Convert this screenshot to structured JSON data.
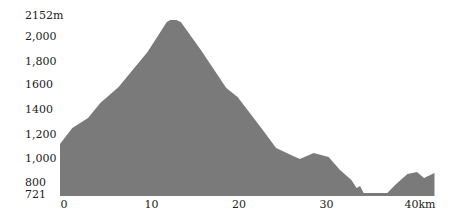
{
  "chart_data": {
    "type": "area",
    "title": "",
    "xlabel": "km",
    "ylabel": "m",
    "fill_color": "#7a7a7a",
    "xlim": [
      0,
      42.8
    ],
    "ylim": [
      721,
      2152
    ],
    "grid": false,
    "legend": null,
    "y_ticks": [
      {
        "value": 2152,
        "label": "2152m"
      },
      {
        "value": 2000,
        "label": "2,000"
      },
      {
        "value": 1800,
        "label": "1,800"
      },
      {
        "value": 1600,
        "label": "1600"
      },
      {
        "value": 1400,
        "label": "1400"
      },
      {
        "value": 1200,
        "label": "1,200"
      },
      {
        "value": 1000,
        "label": "1,000"
      },
      {
        "value": 800,
        "label": "800"
      },
      {
        "value": 721,
        "label": "721"
      }
    ],
    "x_ticks": [
      {
        "value": 0,
        "label": "0"
      },
      {
        "value": 10,
        "label": "10"
      },
      {
        "value": 20,
        "label": "20"
      },
      {
        "value": 30,
        "label": "30"
      },
      {
        "value": 40,
        "label": "40km"
      }
    ],
    "x": [
      0,
      1.4,
      3.2,
      4.6,
      6.7,
      10,
      12.2,
      12.6,
      13.3,
      13.8,
      16.1,
      19,
      20.3,
      23,
      24.7,
      26.4,
      27.4,
      29,
      30.7,
      32,
      33.3,
      33.9,
      34.3,
      34.7,
      37.4,
      38.3,
      39.7,
      40.8,
      41.6,
      42.8
    ],
    "values": [
      1144,
      1274,
      1355,
      1477,
      1607,
      1892,
      2136,
      2152,
      2152,
      2136,
      1908,
      1599,
      1526,
      1274,
      1111,
      1054,
      1022,
      1070,
      1038,
      932,
      851,
      786,
      802,
      745,
      745,
      810,
      900,
      916,
      867,
      908
    ]
  }
}
